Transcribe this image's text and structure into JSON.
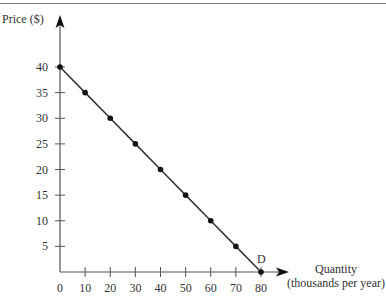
{
  "chart_data": {
    "type": "line",
    "title": "",
    "xlabel": "Quantity (thousands per year)",
    "xlabel_lines": [
      "Quantity",
      "(thousands per year)"
    ],
    "ylabel": "Price ($)",
    "curve_label": "D",
    "x": [
      0,
      10,
      20,
      30,
      40,
      50,
      60,
      70,
      80
    ],
    "series": [
      {
        "name": "D",
        "values": [
          40,
          35,
          30,
          25,
          20,
          15,
          10,
          5,
          0
        ]
      }
    ],
    "x_ticks": [
      "0",
      "10",
      "20",
      "30",
      "40",
      "50",
      "60",
      "70",
      "80"
    ],
    "y_ticks": [
      "5",
      "10",
      "15",
      "20",
      "25",
      "30",
      "35",
      "40"
    ],
    "xlim": [
      0,
      80
    ],
    "ylim": [
      0,
      40
    ],
    "grid": false,
    "legend": "none",
    "markers": true
  }
}
